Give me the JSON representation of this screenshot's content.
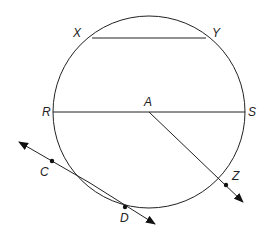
{
  "diagram": {
    "circle": {
      "center": "A",
      "cx": 149,
      "cy": 112,
      "r": 96
    },
    "labels": {
      "X": "X",
      "Y": "Y",
      "R": "R",
      "S": "S",
      "A": "A",
      "C": "C",
      "D": "D",
      "Z": "Z"
    },
    "segments": [
      {
        "name": "chord-XY",
        "from": "X",
        "to": "Y"
      },
      {
        "name": "diameter-RS",
        "from": "R",
        "to": "S"
      }
    ],
    "rays": [
      {
        "name": "ray-AZ",
        "from": "A",
        "through": "Z"
      }
    ],
    "lines": [
      {
        "name": "tangent-line-CD",
        "through": [
          "C",
          "D"
        ]
      }
    ]
  }
}
